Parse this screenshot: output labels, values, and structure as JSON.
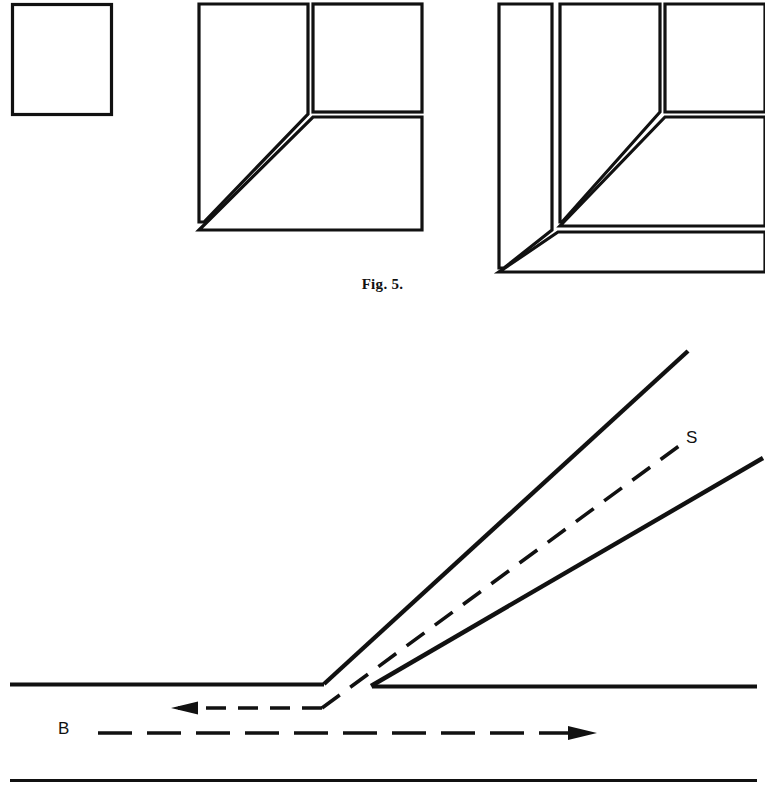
{
  "page": {
    "width": 765,
    "height": 802,
    "background": "#ffffff",
    "ink": "#000000"
  },
  "figures": [
    {
      "id": "fig5",
      "caption": "Fig. 5.",
      "description": "Three line-drawn diagrams of picture-frame mitre joints in progressive stages of assembly",
      "panels": [
        {
          "name": "panel-single-square",
          "description": "A single empty square outline",
          "rect": {
            "x": 11,
            "y": 3,
            "w": 101,
            "h": 112
          }
        },
        {
          "name": "panel-two-members-mitre",
          "description": "Large L-shaped frame with a diagonal mitre joint at the inner corner and a separate upper-right square",
          "bounds": {
            "x": 197,
            "y": 3,
            "w": 227,
            "h": 228
          }
        },
        {
          "name": "panel-three-members-mitre",
          "description": "Nested double L-shaped frame with diagonal mitre joints and an upper-right square",
          "bounds": {
            "x": 497,
            "y": 3,
            "w": 268,
            "h": 268
          }
        }
      ]
    },
    {
      "id": "fig6",
      "description": "Schematic of a shear / slip line S branching upward from a horizontal boundary, with direction arrows B",
      "labels": [
        {
          "name": "label-S",
          "text": "S",
          "x": 686,
          "y": 429
        },
        {
          "name": "label-B",
          "text": "B",
          "x": 58,
          "y": 720
        }
      ],
      "elements": [
        {
          "name": "upper-boundary-line",
          "style": "solid",
          "kind": "horizontal-left-segment"
        },
        {
          "name": "right-boundary-line",
          "style": "solid",
          "kind": "horizontal-right-segment"
        },
        {
          "name": "upper-branch-line",
          "style": "solid",
          "kind": "rising-diagonal"
        },
        {
          "name": "lower-branch-line",
          "style": "solid",
          "kind": "rising-diagonal"
        },
        {
          "name": "slip-line-s",
          "style": "dashed",
          "kind": "rising-diagonal"
        },
        {
          "name": "left-arrow-dashed",
          "style": "dashed",
          "kind": "arrow-left"
        },
        {
          "name": "right-arrow-dashed",
          "style": "dashed",
          "kind": "arrow-right"
        },
        {
          "name": "bottom-boundary-line",
          "style": "solid",
          "kind": "horizontal-full"
        }
      ]
    }
  ]
}
